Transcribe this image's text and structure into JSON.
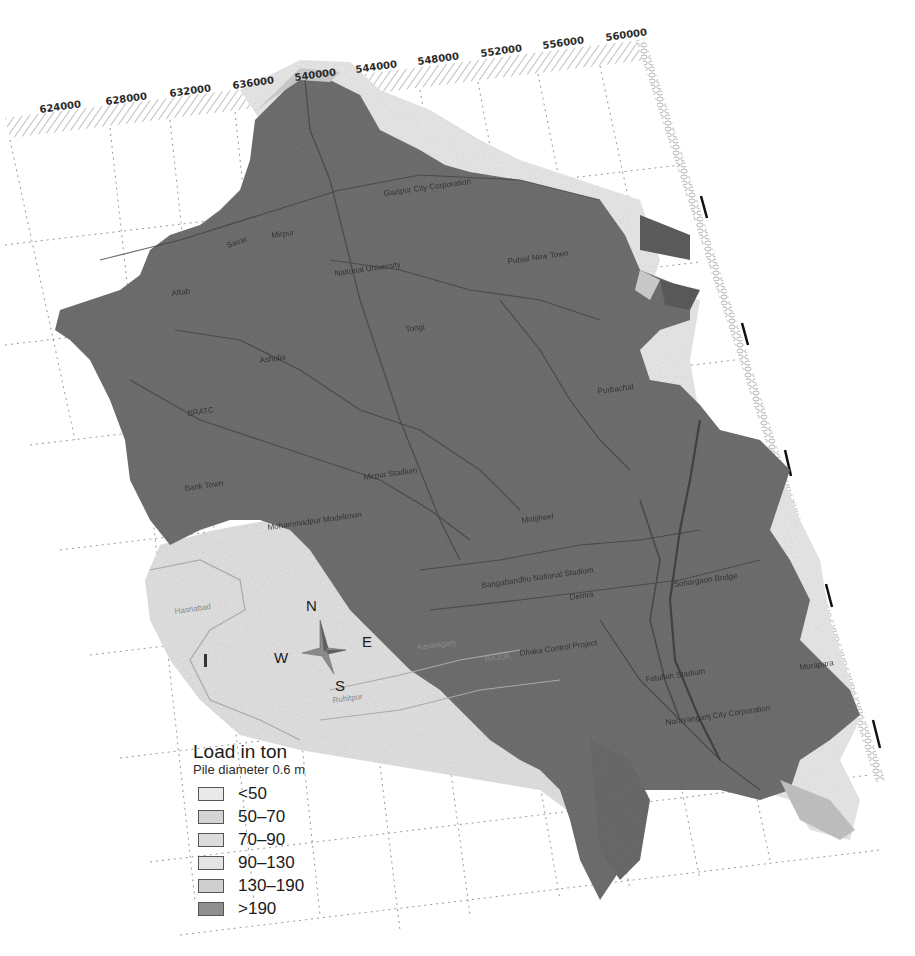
{
  "figure": {
    "type": "load-capacity-map",
    "view": "tilted-perspective"
  },
  "axis": {
    "top_ticks": [
      "624000",
      "628000",
      "632000",
      "636000",
      "540000",
      "544000",
      "548000",
      "552000",
      "556000",
      "560000"
    ],
    "right_ticks_count": 7
  },
  "compass": {
    "north": "N",
    "south": "S",
    "east": "E",
    "west": "W"
  },
  "places": [
    {
      "name": "Gazipur City Corporation",
      "region": ">190"
    },
    {
      "name": "Mirpur",
      "region": ">190"
    },
    {
      "name": "Savar",
      "region": ">190"
    },
    {
      "name": "National University",
      "region": ">190"
    },
    {
      "name": "Pubail New Town",
      "region": ">190"
    },
    {
      "name": "Aftab",
      "region": ">190"
    },
    {
      "name": "Ashulia",
      "region": ">190"
    },
    {
      "name": "Tongi",
      "region": ">190"
    },
    {
      "name": "BRATC",
      "region": ">190"
    },
    {
      "name": "Purbachal",
      "region": ">190"
    },
    {
      "name": "Bank Town",
      "region": ">190"
    },
    {
      "name": "Mirpur Stadium",
      "region": ">190"
    },
    {
      "name": "Mohammadpur Modeltown",
      "region": ">190"
    },
    {
      "name": "Motijheel",
      "region": ">190"
    },
    {
      "name": "Bangabandhu National Stadium",
      "region": ">190"
    },
    {
      "name": "Demra",
      "region": ">190"
    },
    {
      "name": "Sonargaon Bridge",
      "region": ">190"
    },
    {
      "name": "Hasnabad",
      "region": "<50"
    },
    {
      "name": "Keraniganj",
      "region": "<50"
    },
    {
      "name": "RAJUK",
      "region": "<50"
    },
    {
      "name": "Ruhitpur",
      "region": "<50"
    },
    {
      "name": "Dhaka Control Project",
      "region": ">190"
    },
    {
      "name": "Fatullah Stadium",
      "region": ">190"
    },
    {
      "name": "Narayanganj City Corporation",
      "region": ">190"
    },
    {
      "name": "Murapara",
      "region": ">190"
    }
  ],
  "legend": {
    "title": "Load in ton",
    "subtitle": "Pile diameter 0.6 m",
    "items": [
      {
        "label": "<50",
        "color": "#e9e9e9"
      },
      {
        "label": "50–70",
        "color": "#d4d4d4"
      },
      {
        "label": "70–90",
        "color": "#dcdcdc"
      },
      {
        "label": "90–130",
        "color": "#e4e4e4"
      },
      {
        "label": "130–190",
        "color": "#cfcfcf"
      },
      {
        "label": ">190",
        "color": "#8f8f8f"
      }
    ]
  },
  "colors": {
    "dark_zone": "#6f6f6f",
    "light_zone": "#e6e6e6",
    "mid_zone": "#c8c8c8",
    "grid": "#9a9a9a",
    "frame": "#bdbdbd",
    "road": "#444444"
  }
}
